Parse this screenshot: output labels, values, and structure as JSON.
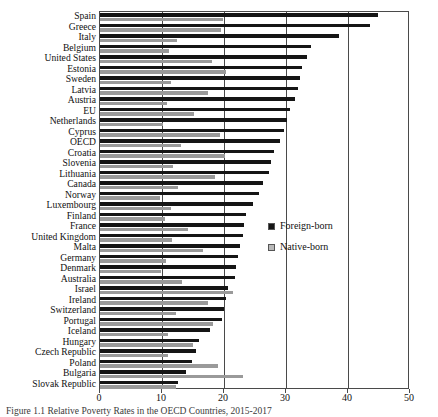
{
  "chart_data": {
    "type": "bar",
    "orientation": "horizontal",
    "title": "",
    "xlabel": "",
    "ylabel": "",
    "xlim": [
      0,
      50
    ],
    "xticks": [
      0,
      10,
      20,
      30,
      40,
      50
    ],
    "xticklabels": [
      "0",
      "10",
      "20",
      "30",
      "40",
      "50"
    ],
    "grid": true,
    "grid_axis": "x",
    "legend_position": "center-right",
    "categories": [
      "Spain",
      "Greece",
      "Italy",
      "Belgium",
      "United States",
      "Estonia",
      "Sweden",
      "Latvia",
      "Austria",
      "EU",
      "Netherlands",
      "Cyprus",
      "OECD",
      "Croatia",
      "Slovenia",
      "Lithuania",
      "Canada",
      "Norway",
      "Luxembourg",
      "Finland",
      "France",
      "United Kingdom",
      "Malta",
      "Germany",
      "Denmark",
      "Australia",
      "Israel",
      "Ireland",
      "Switzerland",
      "Portugal",
      "Iceland",
      "Hungary",
      "Czech Republic",
      "Poland",
      "Bulgaria",
      "Slovak Republic"
    ],
    "series": [
      {
        "name": "Foreign-born",
        "color": "#151515",
        "values": [
          44.8,
          43.5,
          38.5,
          34.0,
          33.4,
          32.6,
          32.3,
          31.9,
          31.4,
          30.6,
          30.2,
          29.6,
          29.0,
          28.0,
          27.6,
          27.2,
          26.3,
          25.6,
          24.6,
          23.6,
          23.2,
          23.0,
          22.5,
          22.3,
          22.0,
          21.7,
          20.7,
          20.4,
          20.0,
          19.6,
          17.8,
          16.0,
          15.5,
          14.8,
          13.8,
          12.6
        ]
      },
      {
        "name": "Native-born",
        "color": "#9a9a9a",
        "values": [
          19.8,
          19.5,
          12.4,
          11.2,
          18.0,
          20.4,
          11.4,
          17.4,
          10.8,
          15.2,
          10.1,
          19.4,
          13.0,
          20.2,
          11.8,
          18.6,
          12.6,
          9.6,
          11.4,
          10.5,
          14.2,
          11.6,
          16.6,
          10.7,
          9.8,
          13.2,
          21.4,
          17.4,
          12.2,
          18.2,
          10.9,
          15.0,
          11.0,
          19.0,
          23.0,
          12.3
        ]
      }
    ]
  },
  "legend": {
    "items": [
      {
        "label": "Foreign-born",
        "swatch": "foreign"
      },
      {
        "label": "Native-born",
        "swatch": "native"
      }
    ]
  },
  "caption": {
    "text": "Figure 1.1 Relative Poverty Rates in the OECD Countries, 2015-2017"
  }
}
